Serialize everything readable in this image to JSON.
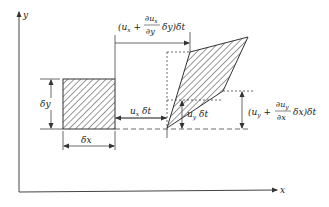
{
  "diagram": {
    "axes": {
      "x_label": "x",
      "y_label": "y"
    },
    "original_element": {
      "width_label": "δx",
      "height_label": "δy"
    },
    "deformed_element": {
      "shape": "parallelogram"
    },
    "annotations": {
      "ux_dt": {
        "base": "u",
        "sub": "x",
        "suffix": " δt"
      },
      "uy_dt": {
        "base": "u",
        "sub": "y",
        "suffix": " δt"
      },
      "top_shift": {
        "open": "(u",
        "sub": "x",
        "plus": " +",
        "num": "∂u",
        "num_sub": "x",
        "den": "∂y",
        "tail": "δy)δt"
      },
      "right_shift": {
        "open": "(u",
        "sub": "y",
        "plus": " +",
        "num": "∂u",
        "num_sub": "y",
        "den": "∂x",
        "tail": "δx)δt"
      }
    },
    "colors": {
      "line": "#333333",
      "hatch": "#333333",
      "background": "#ffffff"
    }
  }
}
